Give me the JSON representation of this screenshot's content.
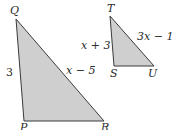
{
  "diagram": {
    "colors": {
      "fill": "#cfcfcf",
      "stroke": "#3a3a3a",
      "text": "#2a2a2a"
    },
    "triangles": [
      {
        "name": "PQR",
        "vertices": {
          "Q": "Q",
          "P": "P",
          "R": "R"
        },
        "sides": {
          "PQ": "3",
          "QR": "x − 5"
        }
      },
      {
        "name": "STU",
        "vertices": {
          "T": "T",
          "S": "S",
          "U": "U"
        },
        "sides": {
          "ST": "x + 3",
          "TU": "3x − 11"
        }
      }
    ]
  }
}
